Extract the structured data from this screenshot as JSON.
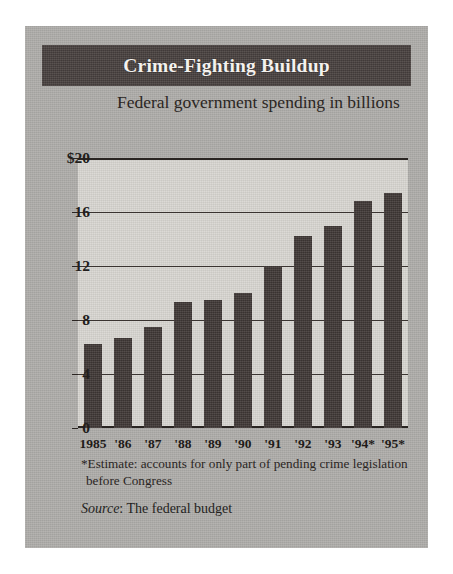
{
  "card": {
    "banner_title": "Crime-Fighting Buildup",
    "subtitle": "Federal government spending in billions"
  },
  "footnotes": {
    "estimate": "*Estimate: accounts for only part of pending crime legislation before Congress",
    "source_label": "Source",
    "source_text": ": The federal budget"
  },
  "colors": {
    "card_background": "#b0aeab",
    "banner_background": "#4a4341",
    "banner_text": "#f4f1ee",
    "plot_background": "#d8d6d1",
    "bar_fill": "#443c3a",
    "gridline": "#3a3431",
    "axis": "#2a2522",
    "text": "#221e1c"
  },
  "chart_data": {
    "type": "bar",
    "title": "Crime-Fighting Buildup",
    "subtitle": "Federal government spending in billions",
    "xlabel": "",
    "ylabel": "",
    "ylim": [
      0,
      20
    ],
    "yticks": [
      0,
      4,
      8,
      12,
      16,
      20
    ],
    "ytick_labels": [
      "0",
      "4",
      "8",
      "12",
      "16",
      "$20"
    ],
    "grid": true,
    "legend": "none",
    "categories": [
      "1985",
      "'86",
      "'87",
      "'88",
      "'89",
      "'90",
      "'91",
      "'92",
      "'93",
      "'94*",
      "'95*"
    ],
    "values": [
      6.2,
      6.7,
      7.5,
      9.3,
      9.5,
      10.0,
      12.0,
      14.2,
      15.0,
      16.8,
      17.4
    ],
    "units": "billions of dollars",
    "annotations": [
      "*Estimate: accounts for only part of pending crime legislation before Congress",
      "Source: The federal budget"
    ]
  }
}
